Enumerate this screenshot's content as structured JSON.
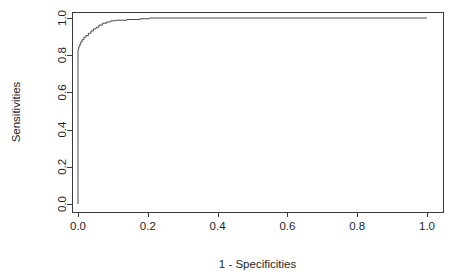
{
  "figure": {
    "background_color": "#ffffff",
    "line_color": "#4a4a4a",
    "axis_color": "#3a3a3a",
    "text_color": "#1f1f1f",
    "partial_top_text": "",
    "plot_box": {
      "left": 72,
      "top": 12,
      "right": 443,
      "bottom": 212
    }
  },
  "chart_data": {
    "type": "line",
    "title": "",
    "subtitle": "",
    "xlabel": "1 - Specificities",
    "ylabel": "Sensitivities",
    "xlim": [
      -0.035,
      1.045
    ],
    "ylim": [
      -0.035,
      1.045
    ],
    "xticks": [
      0.0,
      0.2,
      0.4,
      0.6,
      0.8,
      1.0
    ],
    "yticks": [
      0.0,
      0.2,
      0.4,
      0.6,
      0.8,
      1.0
    ],
    "xtick_labels": [
      "0.0",
      "0.2",
      "0.4",
      "0.6",
      "0.8",
      "1.0"
    ],
    "ytick_labels": [
      "0.0",
      "0.2",
      "0.4",
      "0.6",
      "0.8",
      "1.0"
    ],
    "grid": false,
    "legend": null,
    "legend_position": "none",
    "box_border": true,
    "annotations": [],
    "series": [
      {
        "name": "ROC curve",
        "step_style": "staircase",
        "color": "#4a4a4a",
        "x": [
          0.0,
          0.0,
          0.002,
          0.002,
          0.005,
          0.005,
          0.008,
          0.008,
          0.012,
          0.012,
          0.017,
          0.017,
          0.023,
          0.023,
          0.03,
          0.03,
          0.037,
          0.037,
          0.044,
          0.044,
          0.052,
          0.052,
          0.06,
          0.06,
          0.07,
          0.07,
          0.082,
          0.082,
          0.094,
          0.094,
          0.108,
          0.108,
          0.14,
          0.14,
          0.178,
          0.178,
          0.205,
          0.205,
          1.0
        ],
        "y": [
          0.0,
          0.83,
          0.83,
          0.845,
          0.845,
          0.858,
          0.858,
          0.872,
          0.872,
          0.884,
          0.884,
          0.897,
          0.897,
          0.906,
          0.906,
          0.918,
          0.918,
          0.93,
          0.93,
          0.941,
          0.941,
          0.95,
          0.95,
          0.962,
          0.962,
          0.972,
          0.972,
          0.979,
          0.979,
          0.985,
          0.985,
          0.988,
          0.988,
          0.992,
          0.992,
          0.996,
          0.996,
          1.0,
          1.0
        ]
      }
    ]
  }
}
